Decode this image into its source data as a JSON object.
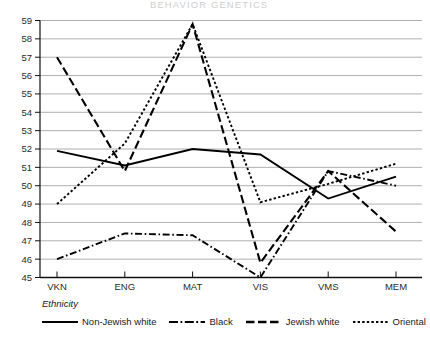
{
  "header": {
    "title": "BEHAVIOR GENETICS"
  },
  "legend": {
    "title": "Ethnicity",
    "position": "below-plot",
    "entries": [
      {
        "label": "Non-Jewish white",
        "dash": "solid"
      },
      {
        "label": "Black",
        "dash": "dashdot"
      },
      {
        "label": "Jewish white",
        "dash": "longdash"
      },
      {
        "label": "Oriental",
        "dash": "dotted"
      }
    ]
  },
  "chart_data": {
    "type": "line",
    "title": "",
    "xlabel": "",
    "ylabel": "",
    "x": [
      "VKN",
      "ENG",
      "MAT",
      "VIS",
      "VMS",
      "MEM"
    ],
    "categories": [
      "VKN",
      "ENG",
      "MAT",
      "VIS",
      "VMS",
      "MEM"
    ],
    "ylim": [
      45,
      59
    ],
    "yticks": [
      45,
      46,
      47,
      48,
      49,
      50,
      51,
      52,
      53,
      54,
      55,
      56,
      57,
      58,
      59
    ],
    "ytick_labels": [
      "45",
      "46",
      "47",
      "48",
      "49",
      "50",
      "51",
      "52",
      "53",
      "54",
      "55",
      "56",
      "57",
      "58",
      "59"
    ],
    "grid": true,
    "grid_axis": "y",
    "legend_position": "below",
    "series": [
      {
        "name": "Non-Jewish white",
        "dash": "solid",
        "values": [
          51.9,
          51.1,
          52.0,
          51.7,
          49.3,
          50.5
        ]
      },
      {
        "name": "Black",
        "dash": "dashdot",
        "values": [
          46.0,
          47.4,
          47.3,
          45.0,
          50.8,
          50.0
        ]
      },
      {
        "name": "Jewish white",
        "dash": "longdash",
        "values": [
          57.0,
          50.8,
          58.8,
          45.8,
          50.8,
          47.5
        ]
      },
      {
        "name": "Oriental",
        "dash": "dotted",
        "values": [
          49.0,
          52.3,
          58.8,
          49.1,
          50.1,
          51.2
        ]
      }
    ]
  }
}
